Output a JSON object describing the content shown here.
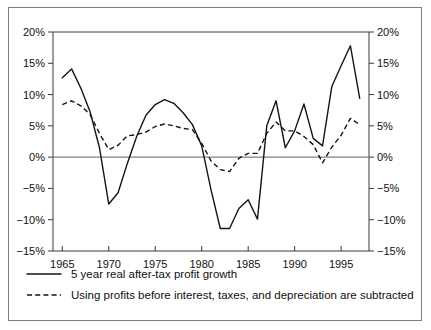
{
  "chart_data": {
    "type": "line",
    "title": "",
    "subtitle": "",
    "xlabel": "",
    "ylabel": "",
    "xlim": [
      1964,
      1998
    ],
    "ylim": [
      -15,
      20
    ],
    "ytick_labels_left": [
      "20%",
      "15%",
      "10%",
      "5%",
      "0%",
      "−5%",
      "−10%",
      "−15%"
    ],
    "ytick_labels_right": [
      "20%",
      "15%",
      "10%",
      "5%",
      "0%",
      "−5%",
      "−10%",
      "−15%"
    ],
    "ytick_values": [
      20,
      15,
      10,
      5,
      0,
      -5,
      -10,
      -15
    ],
    "xtick_labels": [
      "1965",
      "1970",
      "1975",
      "1980",
      "1985",
      "1990",
      "1995"
    ],
    "xtick_values": [
      1965,
      1970,
      1975,
      1980,
      1985,
      1990,
      1995
    ],
    "grid": false,
    "zero_line": true,
    "legend_position": "below",
    "dual_y_axis": true,
    "x": [
      1965,
      1966,
      1967,
      1968,
      1969,
      1970,
      1971,
      1972,
      1973,
      1974,
      1975,
      1976,
      1977,
      1978,
      1979,
      1980,
      1981,
      1982,
      1983,
      1984,
      1985,
      1986,
      1987,
      1988,
      1989,
      1990,
      1991,
      1992,
      1993,
      1994,
      1995,
      1996,
      1997
    ],
    "series": [
      {
        "name": "5 year real after-tax profit growth",
        "style": "solid",
        "color": "#141414",
        "values": [
          12.7,
          14.1,
          11.0,
          7.2,
          1.5,
          -7.5,
          -5.7,
          -1.0,
          3.3,
          6.7,
          8.4,
          9.2,
          8.6,
          7.1,
          5.2,
          1.8,
          -5.2,
          -11.4,
          -11.4,
          -8.2,
          -6.8,
          -9.9,
          5.0,
          9.0,
          1.5,
          4.2,
          8.5,
          3.0,
          1.8,
          11.3,
          14.6,
          17.8,
          9.4
        ]
      },
      {
        "name": "Using profits before interest, taxes, and depreciation are subtracted",
        "style": "dashed",
        "color": "#141414",
        "values": [
          8.4,
          9.0,
          8.2,
          6.8,
          3.8,
          1.2,
          1.9,
          3.4,
          3.6,
          4.0,
          4.9,
          5.3,
          5.0,
          4.6,
          4.4,
          2.2,
          -0.6,
          -2.0,
          -2.3,
          -0.2,
          0.6,
          0.6,
          3.8,
          5.6,
          4.2,
          4.2,
          3.3,
          2.0,
          -0.9,
          1.6,
          3.5,
          6.2,
          5.2
        ]
      }
    ],
    "legend": [
      {
        "label": "5 year real after-tax profit growth",
        "style": "solid"
      },
      {
        "label": "Using profits before interest, taxes, and depreciation are subtracted",
        "style": "dashed"
      }
    ]
  }
}
